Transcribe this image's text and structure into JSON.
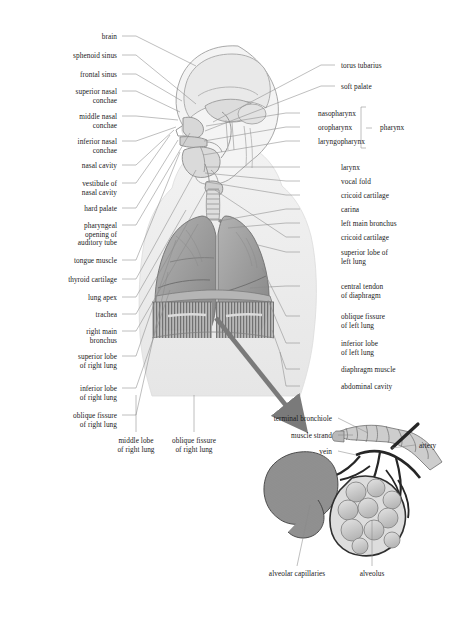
{
  "figure": {
    "background": "#ffffff",
    "ink": "#1a1a1a",
    "leader_color": "#7d7d7d",
    "palette": {
      "lung": "#9c9c9c",
      "lung_dark": "#7e7e7e",
      "body_silhouette": "#ececec",
      "head_outline": "#b4b4b4",
      "diaphragm": "#8f8f8f",
      "arrow": "#7a7a7a",
      "capillary": "#4a4a4a",
      "alveolus": "#c9c9c9",
      "vessel": "#2b2b2b"
    }
  },
  "left_labels": [
    {
      "text": "brain",
      "x": 62,
      "y": 33,
      "w": 55,
      "lx": 122,
      "ly": 36,
      "tx": 196,
      "ty": 66
    },
    {
      "text": "sphenoid sinus",
      "x": 28,
      "y": 52,
      "w": 89,
      "lx": 122,
      "ly": 55,
      "tx": 196,
      "ty": 104
    },
    {
      "text": "frontal sinus",
      "x": 40,
      "y": 71,
      "w": 77,
      "lx": 122,
      "ly": 74,
      "tx": 182,
      "ty": 101
    },
    {
      "text": "superior nasal\nconchae",
      "x": 36,
      "y": 88,
      "w": 81,
      "lx": 122,
      "ly": 91,
      "tx": 180,
      "ty": 112
    },
    {
      "text": "middle nasal\nconchae",
      "x": 40,
      "y": 113,
      "w": 77,
      "lx": 122,
      "ly": 116,
      "tx": 178,
      "ty": 120
    },
    {
      "text": "inferior nasal\nconchae",
      "x": 38,
      "y": 138,
      "w": 79,
      "lx": 122,
      "ly": 141,
      "tx": 176,
      "ty": 127
    },
    {
      "text": "nasal cavity",
      "x": 46,
      "y": 162,
      "w": 71,
      "lx": 122,
      "ly": 165,
      "tx": 174,
      "ty": 130
    },
    {
      "text": "vestibule of\nnasal cavity",
      "x": 44,
      "y": 180,
      "w": 73,
      "lx": 122,
      "ly": 183,
      "tx": 170,
      "ty": 135
    },
    {
      "text": "hard palate",
      "x": 48,
      "y": 205,
      "w": 69,
      "lx": 122,
      "ly": 208,
      "tx": 178,
      "ty": 140
    },
    {
      "text": "pharyngeal\nopening of\nauditory tube",
      "x": 38,
      "y": 222,
      "w": 79,
      "lx": 122,
      "ly": 225,
      "tx": 190,
      "ty": 133
    },
    {
      "text": "tongue muscle",
      "x": 30,
      "y": 257,
      "w": 87,
      "lx": 122,
      "ly": 260,
      "tx": 180,
      "ty": 152
    },
    {
      "text": "thyroid cartilage",
      "x": 24,
      "y": 276,
      "w": 93,
      "lx": 122,
      "ly": 279,
      "tx": 196,
      "ty": 170
    },
    {
      "text": "lung apex",
      "x": 52,
      "y": 294,
      "w": 65,
      "lx": 122,
      "ly": 297,
      "tx": 186,
      "ty": 210
    },
    {
      "text": "trachea",
      "x": 60,
      "y": 311,
      "w": 57,
      "lx": 122,
      "ly": 314,
      "tx": 206,
      "ty": 190
    },
    {
      "text": "right main\nbronchus",
      "x": 52,
      "y": 328,
      "w": 65,
      "lx": 122,
      "ly": 331,
      "tx": 198,
      "ty": 224
    },
    {
      "text": "superior lobe\nof right lung",
      "x": 40,
      "y": 353,
      "w": 77,
      "lx": 122,
      "ly": 356,
      "tx": 176,
      "ty": 240
    },
    {
      "text": "inferior lobe\nof right lung",
      "x": 42,
      "y": 385,
      "w": 75,
      "lx": 122,
      "ly": 388,
      "tx": 170,
      "ty": 290
    },
    {
      "text": "oblique fissure\nof right lung",
      "x": 34,
      "y": 412,
      "w": 83,
      "lx": 122,
      "ly": 415,
      "tx": 168,
      "ty": 272
    }
  ],
  "right_labels": [
    {
      "text": "torus tubarius",
      "x": 341,
      "y": 62,
      "lx": 335,
      "ly": 65,
      "tx": 213,
      "ty": 122
    },
    {
      "text": "soft palate",
      "x": 341,
      "y": 83,
      "lx": 335,
      "ly": 86,
      "tx": 205,
      "ty": 131
    },
    {
      "text": "nasopharynx",
      "x": 318,
      "y": 110,
      "lx": 300,
      "ly": 113,
      "tx": 206,
      "ty": 126
    },
    {
      "text": "oropharynx",
      "x": 318,
      "y": 124,
      "lx": 300,
      "ly": 127,
      "tx": 204,
      "ty": 141
    },
    {
      "text": "laryngopharynx",
      "x": 318,
      "y": 138,
      "lx": 300,
      "ly": 141,
      "tx": 203,
      "ty": 155
    },
    {
      "text": "larynx",
      "x": 341,
      "y": 164,
      "lx": 300,
      "ly": 167,
      "tx": 206,
      "ty": 167
    },
    {
      "text": "vocal fold",
      "x": 341,
      "y": 178,
      "lx": 300,
      "ly": 181,
      "tx": 205,
      "ty": 173
    },
    {
      "text": "cricoid cartilage",
      "x": 341,
      "y": 192,
      "lx": 300,
      "ly": 195,
      "tx": 207,
      "ty": 182
    },
    {
      "text": "carina",
      "x": 341,
      "y": 206,
      "lx": 300,
      "ly": 209,
      "tx": 219,
      "ty": 221
    },
    {
      "text": "left main bronchus",
      "x": 341,
      "y": 220,
      "lx": 300,
      "ly": 223,
      "tx": 228,
      "ty": 228
    },
    {
      "text": "cricoid cartilage",
      "x": 341,
      "y": 234,
      "lx": 300,
      "ly": 237,
      "tx": 215,
      "ty": 190
    },
    {
      "text": "superior lobe of\nleft lung",
      "x": 341,
      "y": 249,
      "lx": 300,
      "ly": 252,
      "tx": 258,
      "ty": 245
    },
    {
      "text": "central tendon\nof diaphragm",
      "x": 341,
      "y": 283,
      "lx": 300,
      "ly": 286,
      "tx": 250,
      "ty": 288
    },
    {
      "text": "oblique fissure\nof left lung",
      "x": 341,
      "y": 313,
      "lx": 300,
      "ly": 316,
      "tx": 262,
      "ty": 268
    },
    {
      "text": "inferior lobe\nof left lung",
      "x": 341,
      "y": 340,
      "lx": 300,
      "ly": 343,
      "tx": 268,
      "ty": 300
    },
    {
      "text": "diaphragm muscle",
      "x": 341,
      "y": 366,
      "lx": 300,
      "ly": 369,
      "tx": 272,
      "ty": 330
    },
    {
      "text": "abdominal cavity",
      "x": 341,
      "y": 383,
      "lx": 300,
      "ly": 386,
      "tx": 280,
      "ty": 352
    }
  ],
  "bracket": {
    "label": "pharynx",
    "x": 380,
    "y": 124,
    "top": 107,
    "bottom": 148,
    "spine_x": 300
  },
  "bottom_labels": [
    {
      "text": "middle lobe\nof right lung",
      "cx": 136,
      "y": 437,
      "lx": 136,
      "ly": 432,
      "tx": 136,
      "ty": 395
    },
    {
      "text": "oblique fissure\nof right lung",
      "cx": 194,
      "y": 437,
      "lx": 194,
      "ly": 432,
      "tx": 194,
      "ty": 395
    }
  ],
  "inset": {
    "title": "alveolus detail",
    "labels_left": [
      {
        "text": "terminal bronchiole",
        "x": 250,
        "y": 415,
        "lx": 338,
        "ly": 418,
        "tx": 368,
        "ty": 433
      },
      {
        "text": "muscle strand",
        "x": 266,
        "y": 432,
        "lx": 338,
        "ly": 435,
        "tx": 353,
        "ty": 435
      },
      {
        "text": "vein",
        "x": 305,
        "y": 448,
        "lx": 338,
        "ly": 451,
        "tx": 356,
        "ty": 455
      }
    ],
    "labels_right": [
      {
        "text": "artery",
        "x": 419,
        "y": 442,
        "lx": 415,
        "ly": 445,
        "tx": 392,
        "ty": 448
      }
    ],
    "labels_bottom": [
      {
        "text": "alveolar capillaries",
        "cx": 297,
        "y": 570,
        "lx": 297,
        "ly": 566,
        "tx": 310,
        "ty": 505
      },
      {
        "text": "alveolus",
        "cx": 372,
        "y": 570,
        "lx": 372,
        "ly": 566,
        "tx": 372,
        "ty": 520
      }
    ]
  }
}
